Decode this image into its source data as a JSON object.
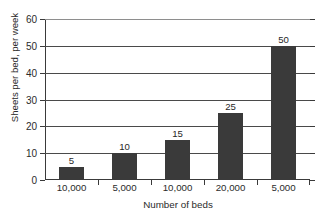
{
  "chart_data": {
    "type": "bar",
    "title": "Utilisation of sheets used in beds",
    "xlabel": "Number of beds",
    "ylabel": "Sheets per bed, per week",
    "categories": [
      "10,000",
      "5,000",
      "10,000",
      "20,000",
      "5,000"
    ],
    "values": [
      5,
      10,
      15,
      25,
      50
    ],
    "value_labels": [
      "5",
      "10",
      "15",
      "25",
      "50"
    ],
    "ylim": [
      0,
      60
    ],
    "ytick_labels": [
      "0",
      "10",
      "20",
      "30",
      "40",
      "50",
      "60"
    ],
    "ytick_values": [
      0,
      10,
      20,
      30,
      40,
      50,
      60
    ],
    "grid": true,
    "legend": false,
    "colors": {
      "bar": "#3a3a3a",
      "axis": "#3a3a3a",
      "grid": "#4a4a4a",
      "text": "#2b2b2b",
      "background": "#ffffff",
      "title": "#7b7b86"
    }
  }
}
